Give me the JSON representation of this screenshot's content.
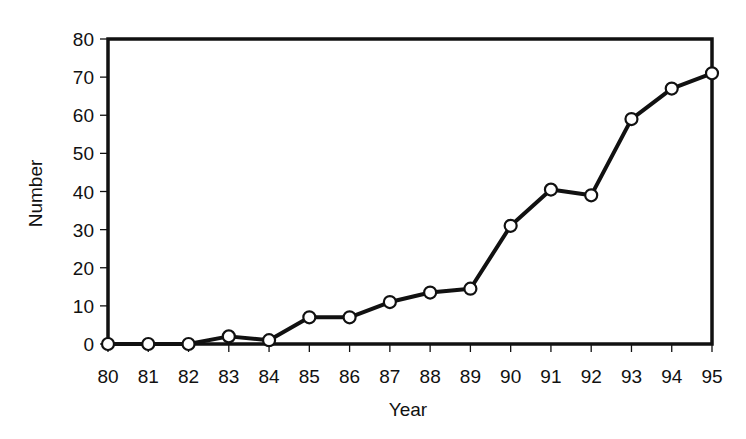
{
  "chart_data": {
    "type": "line",
    "title": "",
    "xlabel": "Year",
    "ylabel": "Number",
    "x": [
      "80",
      "81",
      "82",
      "83",
      "84",
      "85",
      "86",
      "87",
      "88",
      "89",
      "90",
      "91",
      "92",
      "93",
      "94",
      "95"
    ],
    "series": [
      {
        "name": "Number",
        "values": [
          0,
          0,
          0,
          2,
          1,
          7,
          7,
          11,
          13.5,
          14.5,
          31,
          40.5,
          39,
          59,
          67,
          71
        ],
        "marker": "open-circle",
        "color": "#111111"
      }
    ],
    "ylim": [
      0,
      80
    ],
    "yticks": [
      "0",
      "10",
      "20",
      "30",
      "40",
      "50",
      "60",
      "70",
      "80"
    ],
    "xticks": [
      "80",
      "81",
      "82",
      "83",
      "84",
      "85",
      "86",
      "87",
      "88",
      "89",
      "90",
      "91",
      "92",
      "93",
      "94",
      "95"
    ],
    "grid": false,
    "legend": "none"
  }
}
